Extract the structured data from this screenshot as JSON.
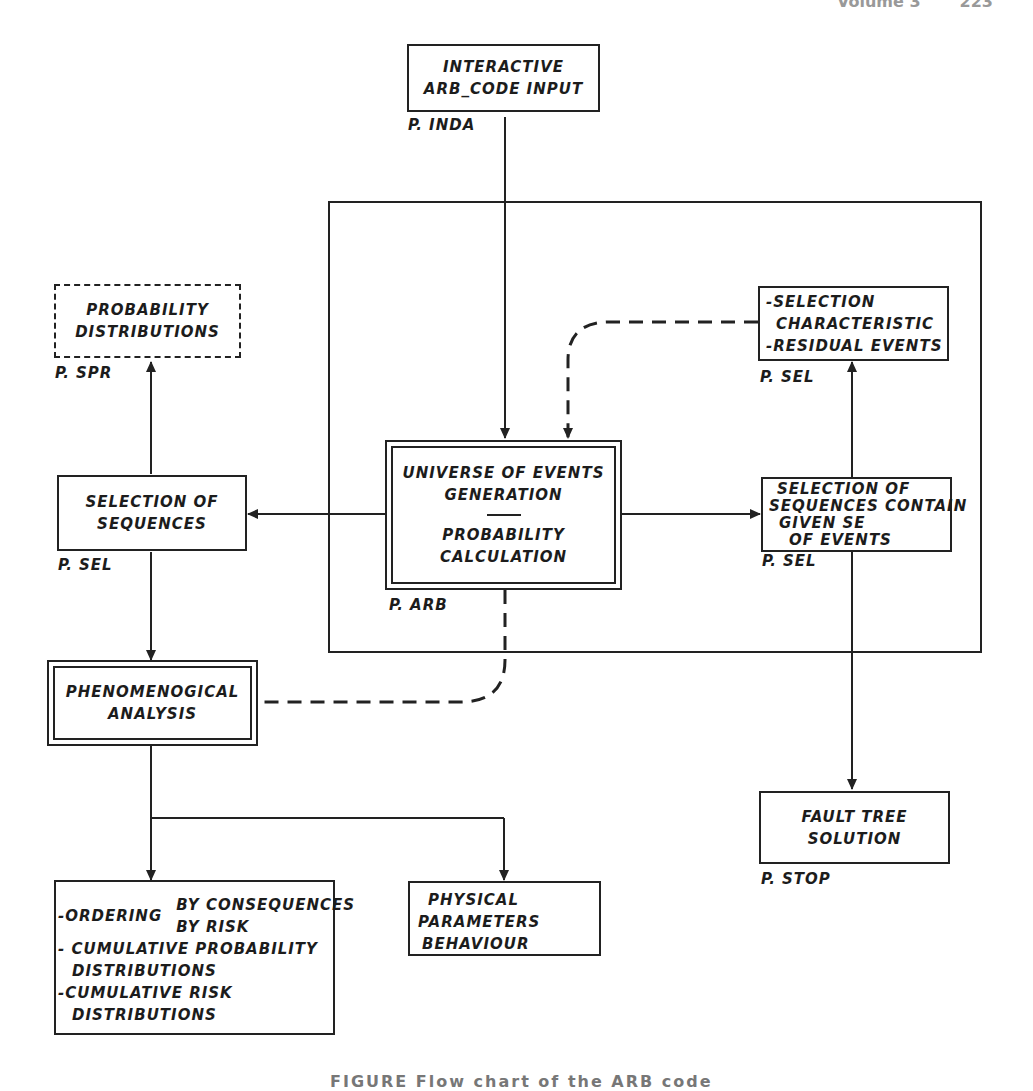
{
  "page_header": {
    "left": "Volume 3",
    "right": "223"
  },
  "caption": "FIGURE  Flow chart of the ARB code",
  "diagram": {
    "nodes": {
      "interactive_input": {
        "lines": [
          "INTERACTIVE",
          "ARB_CODE INPUT"
        ],
        "program": "P. INDA",
        "style": "solid"
      },
      "probability_distributions": {
        "lines": [
          "PROBABILITY",
          "DISTRIBUTIONS"
        ],
        "program": "P. SPR",
        "style": "dashed"
      },
      "selection_characteristic": {
        "lines": [
          "-SELECTION",
          " CHARACTERISTIC",
          "-RESIDUAL EVENTS"
        ],
        "program": "P. SEL",
        "style": "solid"
      },
      "selection_of_sequences": {
        "lines": [
          "SELECTION OF",
          "SEQUENCES"
        ],
        "program": "P. SEL",
        "style": "solid"
      },
      "universe_of_events": {
        "lines": [
          "UNIVERSE OF EVENTS",
          "GENERATION"
        ],
        "lines2": [
          "PROBABILITY",
          "CALCULATION"
        ],
        "program": "P. ARB",
        "style": "double"
      },
      "selection_given_set": {
        "lines": [
          "SELECTION OF",
          "SEQUENCES CONTAIN",
          " GIVEN SE",
          "  OF EVENTS"
        ],
        "program": "P. SEL",
        "style": "solid"
      },
      "phenomenological_analysis": {
        "lines": [
          "PHENOMENOGICAL",
          "ANALYSIS"
        ],
        "style": "double"
      },
      "fault_tree_solution": {
        "lines": [
          "FAULT TREE",
          "SOLUTION"
        ],
        "program": "P. STOP",
        "style": "solid"
      },
      "ordering": {
        "ordering_label": "-ORDERING",
        "ordering_options": [
          "BY CONSEQUENCES",
          "BY RISK"
        ],
        "lines": [
          "- CUMULATIVE PROBABILITY",
          "  DISTRIBUTIONS",
          "-CUMULATIVE RISK",
          "  DISTRIBUTIONS"
        ],
        "style": "solid"
      },
      "physical_parameters": {
        "lines": [
          "PHYSICAL",
          "PARAMETERS",
          "BEHAVIOUR"
        ],
        "style": "solid"
      }
    },
    "edges": [
      {
        "from": "interactive_input",
        "to": "universe_of_events",
        "style": "solid"
      },
      {
        "from": "selection_characteristic",
        "to": "universe_of_events",
        "style": "dashed"
      },
      {
        "from": "universe_of_events",
        "to": "selection_of_sequences",
        "style": "solid"
      },
      {
        "from": "universe_of_events",
        "to": "selection_given_set",
        "style": "solid"
      },
      {
        "from": "selection_of_sequences",
        "to": "probability_distributions",
        "style": "solid"
      },
      {
        "from": "selection_of_sequences",
        "to": "phenomenological_analysis",
        "style": "solid"
      },
      {
        "from": "selection_given_set",
        "to": "selection_characteristic",
        "style": "solid"
      },
      {
        "from": "selection_given_set",
        "to": "fault_tree_solution",
        "style": "solid"
      },
      {
        "from": "universe_of_events",
        "to": "phenomenological_analysis",
        "style": "dashed"
      },
      {
        "from": "phenomenological_analysis",
        "to": "ordering",
        "style": "solid"
      },
      {
        "from": "phenomenological_analysis",
        "to": "physical_parameters",
        "style": "solid"
      }
    ],
    "colors": {
      "ink": "#222222",
      "paper": "#ffffff"
    }
  }
}
